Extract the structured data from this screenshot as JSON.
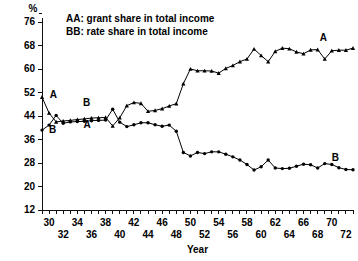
{
  "chart_data": {
    "type": "line",
    "title": "",
    "xlabel": "Year",
    "ylabel": "%",
    "ylim": [
      12,
      76
    ],
    "xlim": [
      29,
      73
    ],
    "grid": false,
    "legend_position": "top-left-inside",
    "y_ticks": [
      12,
      20,
      28,
      36,
      44,
      52,
      60,
      68,
      76
    ],
    "x_ticks_upper": [
      30,
      34,
      38,
      42,
      46,
      50,
      54,
      58,
      62,
      66,
      70
    ],
    "x_ticks_lower": [
      32,
      36,
      40,
      44,
      48,
      52,
      56,
      60,
      64,
      68,
      72
    ],
    "x_minor_ticks": [
      29,
      30,
      31,
      32,
      33,
      34,
      35,
      36,
      37,
      38,
      39,
      40,
      41,
      42,
      43,
      44,
      45,
      46,
      47,
      48,
      49,
      50,
      51,
      52,
      53,
      54,
      55,
      56,
      57,
      58,
      59,
      60,
      61,
      62,
      63,
      64,
      65,
      66,
      67,
      68,
      69,
      70,
      71,
      72,
      73
    ],
    "annotations": [
      {
        "text": "A",
        "x": 30.6,
        "y": 50.0
      },
      {
        "text": "B",
        "x": 30.5,
        "y": 38.3
      },
      {
        "text": "B",
        "x": 35.3,
        "y": 47.5
      },
      {
        "text": "A",
        "x": 35.4,
        "y": 40.0
      },
      {
        "text": "A",
        "x": 68.8,
        "y": 69.5
      },
      {
        "text": "B",
        "x": 70.5,
        "y": 28.6
      }
    ],
    "x": [
      29,
      30,
      31,
      32,
      33,
      34,
      35,
      36,
      37,
      38,
      39,
      40,
      41,
      42,
      43,
      44,
      45,
      46,
      47,
      48,
      49,
      50,
      51,
      52,
      53,
      54,
      55,
      56,
      57,
      58,
      59,
      60,
      61,
      62,
      63,
      64,
      65,
      66,
      67,
      68,
      69,
      70,
      71,
      72,
      73
    ],
    "series": [
      {
        "name": "AA",
        "label": "AA: grant share in total income",
        "marker": "filled-triangle",
        "values": [
          50.4,
          45.0,
          42.0,
          42.3,
          42.5,
          42.8,
          43.0,
          43.3,
          43.4,
          43.5,
          40.6,
          43.4,
          47.5,
          48.6,
          48.3,
          45.6,
          45.9,
          46.5,
          47.4,
          48.2,
          55.0,
          60.0,
          59.4,
          59.4,
          59.3,
          58.6,
          60.2,
          61.2,
          62.5,
          63.4,
          66.8,
          64.6,
          62.5,
          66.0,
          67.1,
          66.9,
          65.8,
          65.2,
          66.5,
          66.6,
          63.4,
          66.2,
          66.4,
          66.4,
          67.1
        ]
      },
      {
        "name": "BB",
        "label": "BB: rate share in total income",
        "marker": "filled-circle",
        "values": [
          39.2,
          40.9,
          44.2,
          41.5,
          42.0,
          42.1,
          42.2,
          42.4,
          42.5,
          42.6,
          46.3,
          41.9,
          40.4,
          41.0,
          41.7,
          41.7,
          41.0,
          40.5,
          40.9,
          38.8,
          31.6,
          30.4,
          31.6,
          31.2,
          31.8,
          31.8,
          31.0,
          30.1,
          29.0,
          27.5,
          25.6,
          26.7,
          29.0,
          26.3,
          26.1,
          26.2,
          26.9,
          27.6,
          27.4,
          26.3,
          27.8,
          27.5,
          26.4,
          25.8,
          25.7
        ]
      }
    ]
  }
}
